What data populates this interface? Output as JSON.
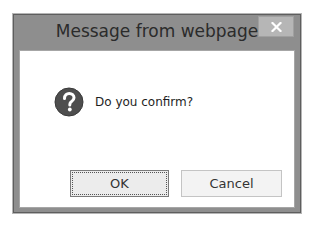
{
  "dialog": {
    "title": "Message from webpage",
    "close_icon": "close-icon",
    "message_icon": "question-icon",
    "message": "Do you confirm?",
    "buttons": {
      "ok_label": "OK",
      "cancel_label": "Cancel"
    }
  },
  "colors": {
    "frame": "#8e8e8e",
    "close_button": "#b6b6b6",
    "icon": "#555555",
    "client_bg": "#ffffff"
  }
}
